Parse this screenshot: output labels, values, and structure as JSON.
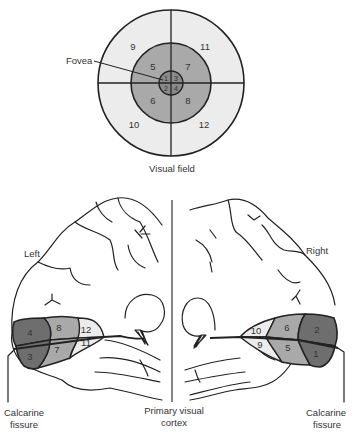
{
  "visual_field": {
    "caption": "Visual field",
    "fovea_label": "Fovea",
    "outer_regions": [
      "9",
      "11",
      "10",
      "12"
    ],
    "middle_regions": [
      "5",
      "7",
      "6",
      "8"
    ],
    "fovea_regions": [
      "1",
      "3",
      "2",
      "4"
    ]
  },
  "brain": {
    "left_label": "Left",
    "right_label": "Right",
    "center_label_line1": "Primary visual",
    "center_label_line2": "cortex",
    "left_calcarine_line1": "Calcarine",
    "left_calcarine_line2": "fissure",
    "right_calcarine_line1": "Calcarine",
    "right_calcarine_line2": "fissure",
    "left_regions": [
      "4",
      "3",
      "8",
      "7",
      "12",
      "11"
    ],
    "right_regions": [
      "10",
      "9",
      "6",
      "5",
      "2",
      "1"
    ]
  },
  "colors": {
    "outer": "#ececec",
    "middle": "#a9a9a9",
    "fovea": "#7a7a7a",
    "dark": "#6e6e6e",
    "line": "#222222"
  }
}
